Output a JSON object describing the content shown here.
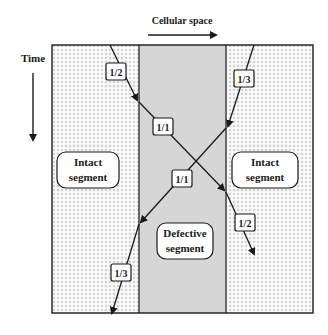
{
  "header": {
    "x_axis_label": "Cellular space",
    "y_axis_label": "Time"
  },
  "segments": [
    {
      "id": "left",
      "line1": "Intact",
      "line2": "segment",
      "fill": "dotted"
    },
    {
      "id": "middle",
      "line1": "Defective",
      "line2": "segment",
      "fill": "#d4d4d4"
    },
    {
      "id": "right",
      "line1": "Intact",
      "line2": "segment",
      "fill": "dotted"
    }
  ],
  "ratios": {
    "left_top": "1/2",
    "right_top": "1/3",
    "middle_upper": "1/1",
    "middle_lower": "1/1",
    "right_bottom": "1/2",
    "left_bottom": "1/3"
  },
  "colors": {
    "line": "#1a1a1a",
    "defective_fill": "#d6d6d6",
    "dot": "#9a9a9a",
    "background": "#ffffff"
  }
}
